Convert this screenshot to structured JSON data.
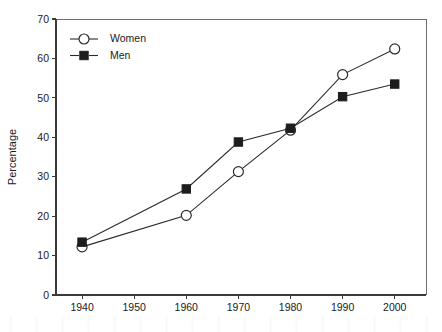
{
  "chart_data": {
    "type": "line",
    "title": "",
    "subtitle": "",
    "xlabel": "",
    "ylabel": "Percentage",
    "x": [
      1940,
      1960,
      1970,
      1980,
      1990,
      2000
    ],
    "xtick_labels": [
      "1940",
      "1950",
      "1960",
      "1970",
      "1980",
      "1990",
      "2000"
    ],
    "xtick_values": [
      1940,
      1950,
      1960,
      1970,
      1980,
      1990,
      2000
    ],
    "ytick_labels": [
      "0",
      "10",
      "20",
      "30",
      "40",
      "50",
      "60",
      "70"
    ],
    "ytick_values": [
      0,
      10,
      20,
      30,
      40,
      50,
      60,
      70
    ],
    "xlim": [
      1935,
      2006
    ],
    "ylim": [
      0,
      70
    ],
    "grid": false,
    "legend_position": "top-left",
    "series": [
      {
        "name": "Women",
        "marker": "open-circle",
        "color": "#2b2b2b",
        "x": [
          1940,
          1960,
          1970,
          1980,
          1990,
          2000
        ],
        "values": [
          12.2,
          20.2,
          31.3,
          41.8,
          55.9,
          62.4
        ]
      },
      {
        "name": "Men",
        "marker": "filled-square",
        "color": "#1d1d1d",
        "x": [
          1940,
          1960,
          1970,
          1980,
          1990,
          2000
        ],
        "values": [
          13.4,
          26.9,
          38.8,
          42.3,
          50.3,
          53.5
        ]
      }
    ],
    "annotations": []
  },
  "legend": {
    "items": [
      {
        "label": "Women",
        "marker": "open-circle"
      },
      {
        "label": "Men",
        "marker": "filled-square"
      }
    ]
  }
}
